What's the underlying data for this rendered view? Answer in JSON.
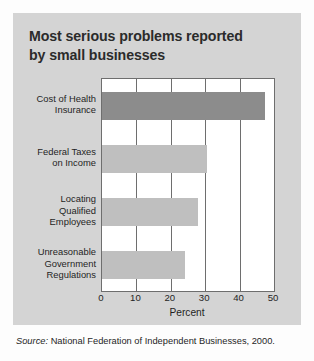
{
  "figure": {
    "title": "Most serious problems reported by small businesses",
    "title_line1": "Most serious problems reported",
    "title_line2": "by small businesses",
    "panel_color": "#d4d4d4",
    "plot_background": "#ffffff",
    "axis_color": "#6e6e6e"
  },
  "source_note": {
    "prefix": "Source:",
    "text": "National Federation of Independent Businesses, 2000."
  },
  "chart_data": {
    "type": "bar",
    "orientation": "horizontal",
    "title": "Most serious problems reported by small businesses",
    "xlabel": "Percent",
    "ylabel": "",
    "xlim": [
      0,
      50
    ],
    "xticks": [
      0,
      10,
      20,
      30,
      40,
      50
    ],
    "xtick_labels": [
      "0",
      "10",
      "20",
      "30",
      "40",
      "50"
    ],
    "grid": true,
    "grid_axis": "x",
    "legend": false,
    "categories": [
      "Cost of Health Insurance",
      "Federal Taxes on Income",
      "Locating Qualified Employees",
      "Unreasonable Government Regulations"
    ],
    "category_label_lines": [
      [
        "Cost of Health",
        "Insurance"
      ],
      [
        "Federal Taxes",
        "on Income"
      ],
      [
        "Locating",
        "Qualified",
        "Employees"
      ],
      [
        "Unreasonable",
        "Government",
        "Regulations"
      ]
    ],
    "values": [
      47.5,
      30.5,
      28,
      24
    ],
    "bar_colors": [
      "#8c8c8c",
      "#bfbfbf",
      "#bfbfbf",
      "#bfbfbf"
    ],
    "highlight_index": 0
  }
}
